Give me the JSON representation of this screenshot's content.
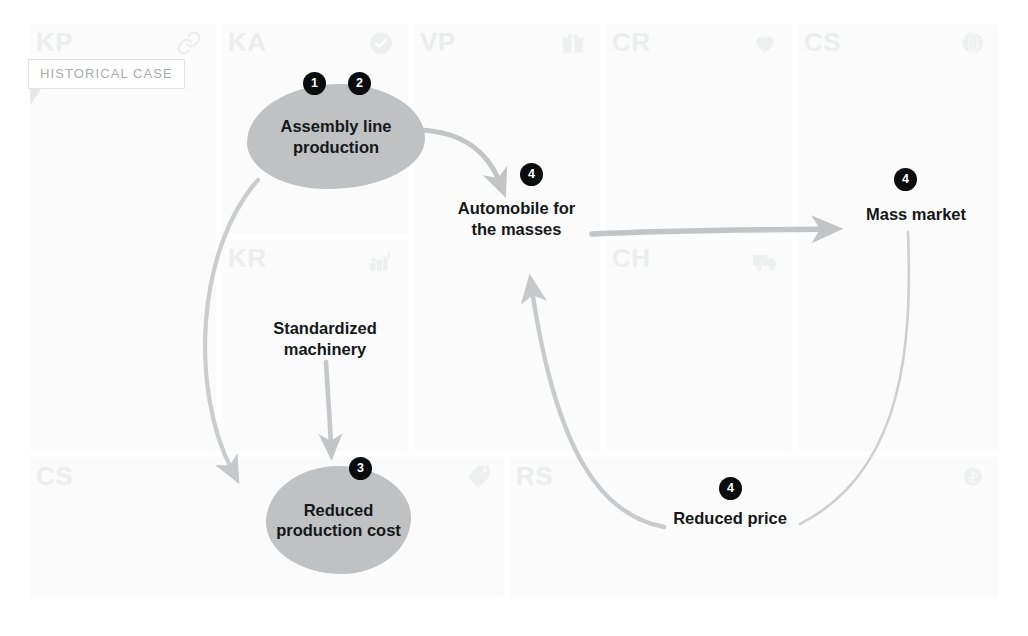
{
  "tag": {
    "label": "HISTORICAL CASE"
  },
  "canvas": {
    "sections": [
      {
        "code": "KP",
        "icon": "link-icon"
      },
      {
        "code": "KA",
        "icon": "check-circle-icon"
      },
      {
        "code": "VP",
        "icon": "gift-icon"
      },
      {
        "code": "CR",
        "icon": "heart-icon"
      },
      {
        "code": "CS",
        "icon": "globe-icon"
      },
      {
        "code": "KR",
        "icon": "factory-icon"
      },
      {
        "code": "CH",
        "icon": "truck-icon"
      },
      {
        "code": "CS",
        "icon": "price-tag-icon"
      },
      {
        "code": "RS",
        "icon": "coin-icon"
      }
    ]
  },
  "nodes": {
    "assembly_line": {
      "label": "Assembly line production",
      "badges": [
        "1",
        "2"
      ]
    },
    "automobile": {
      "label": "Automobile for the masses",
      "badges": [
        "4"
      ]
    },
    "mass_market": {
      "label": "Mass market",
      "badges": [
        "4"
      ]
    },
    "standardized_machinery": {
      "label": "Standardized machinery",
      "badges": []
    },
    "reduced_production_cost": {
      "label": "Reduced production cost",
      "badges": [
        "3"
      ]
    },
    "reduced_price": {
      "label": "Reduced price",
      "badges": [
        "4"
      ]
    }
  },
  "badges": {
    "one": "1",
    "two": "2",
    "three": "3",
    "four_automobile": "4",
    "four_massmarket": "4",
    "four_price": "4"
  },
  "colors": {
    "blob": "#bfc1c2",
    "badge": "#0b0c0d",
    "arrow": "#c2c4c5",
    "grid": "#fbfbfb",
    "section_label": "#eceded",
    "tag_text": "#a9abad"
  }
}
